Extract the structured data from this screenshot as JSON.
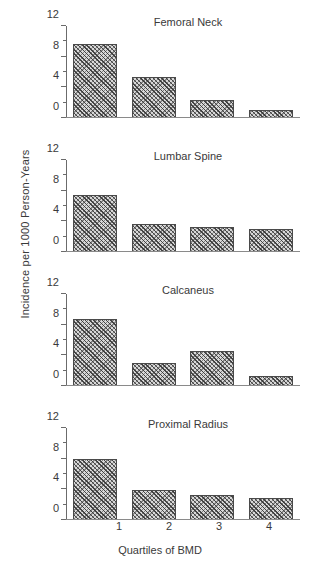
{
  "figure": {
    "ylabel": "Incidence per 1000 Person-Years",
    "xlabel": "Quartiles of BMD",
    "background": "#ffffff",
    "bar_fill": "#d8d8d8",
    "bar_edge": "#4a4a4a",
    "axis_color": "#6b6b6b"
  },
  "chart_data": {
    "type": "bar",
    "xlabel": "Quartiles of BMD",
    "ylabel": "Incidence per 1000 Person-Years",
    "categories": [
      "1",
      "2",
      "3",
      "4"
    ],
    "ylim": [
      0,
      12
    ],
    "yticks": [
      0,
      4,
      8,
      12
    ],
    "yticks_minor": [
      2,
      6,
      10
    ],
    "ytick_labels": [
      "0",
      "4",
      "8",
      "12"
    ],
    "grid": false,
    "legend": "none",
    "panel_layout": "4 rows x 1 column, shared axes",
    "panels": [
      {
        "title": "Femoral Neck",
        "categories": [
          "1",
          "2",
          "3",
          "4"
        ],
        "values": [
          9.6,
          5.3,
          2.3,
          1.0
        ]
      },
      {
        "title": "Lumbar Spine",
        "categories": [
          "1",
          "2",
          "3",
          "4"
        ],
        "values": [
          7.5,
          3.6,
          3.3,
          3.0
        ]
      },
      {
        "title": "Calcaneus",
        "categories": [
          "1",
          "2",
          "3",
          "4"
        ],
        "values": [
          8.8,
          3.0,
          4.6,
          1.3
        ]
      },
      {
        "title": "Proximal Radius",
        "categories": [
          "1",
          "2",
          "3",
          "4"
        ],
        "values": [
          7.9,
          3.9,
          3.2,
          2.9
        ]
      }
    ]
  }
}
